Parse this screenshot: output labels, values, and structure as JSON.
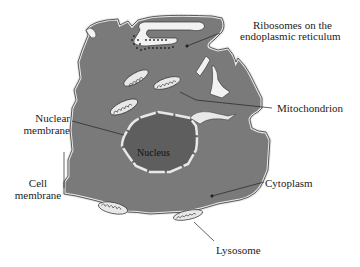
{
  "diagram": {
    "colors": {
      "cytoplasm": "#7a7a7a",
      "nucleus": "#5e5e5e",
      "membrane": "#e8e8e8",
      "outline": "#333333",
      "background": "#ffffff"
    },
    "labels": {
      "ribosomes": [
        "Ribosomes on the",
        "endoplasmic reticulum"
      ],
      "mitochondrion": "Mitochondrion",
      "nuclear_membrane": [
        "Nuclear",
        "membrane"
      ],
      "nucleus": "Nucleus",
      "cell_membrane": [
        "Cell",
        "membrane"
      ],
      "cytoplasm": "Cytoplasm",
      "lysosome": "Lysosome"
    }
  }
}
